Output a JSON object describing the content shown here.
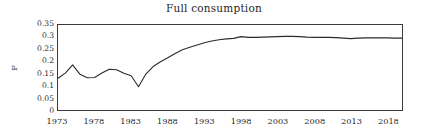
{
  "chart_data": {
    "type": "line",
    "title": "Full consumption",
    "xlabel": "",
    "ylabel": "F",
    "xlim": [
      1973,
      2020
    ],
    "ylim": [
      0,
      0.35
    ],
    "grid": false,
    "legend": null,
    "legend_position": "none",
    "y_ticks": [
      "0.35",
      "0.3",
      "0.25",
      "0.2",
      "0.15",
      "0.1",
      "0.05",
      "0"
    ],
    "y_tick_values": [
      0.35,
      0.3,
      0.25,
      0.2,
      0.15,
      0.1,
      0.05,
      0
    ],
    "x_ticks": [
      "1973",
      "1978",
      "1983",
      "1988",
      "1993",
      "1998",
      "2003",
      "2008",
      "2013",
      "2018"
    ],
    "x_tick_values": [
      1973,
      1978,
      1983,
      1988,
      1993,
      1998,
      2003,
      2008,
      2013,
      2018
    ],
    "line_color": "#2b2b2b",
    "x": [
      1973,
      1974,
      1975,
      1976,
      1977,
      1978,
      1979,
      1980,
      1981,
      1982,
      1983,
      1984,
      1985,
      1986,
      1987,
      1988,
      1989,
      1990,
      1991,
      1992,
      1993,
      1994,
      1995,
      1996,
      1997,
      1998,
      1999,
      2000,
      2001,
      2002,
      2003,
      2004,
      2005,
      2006,
      2007,
      2008,
      2009,
      2010,
      2011,
      2012,
      2013,
      2014,
      2015,
      2016,
      2017,
      2018,
      2019,
      2020
    ],
    "series": [
      {
        "name": "F",
        "values": [
          0.131,
          0.152,
          0.186,
          0.147,
          0.133,
          0.134,
          0.152,
          0.168,
          0.166,
          0.151,
          0.141,
          0.096,
          0.148,
          0.179,
          0.199,
          0.215,
          0.233,
          0.248,
          0.258,
          0.268,
          0.277,
          0.284,
          0.289,
          0.293,
          0.295,
          0.302,
          0.299,
          0.299,
          0.3,
          0.301,
          0.302,
          0.303,
          0.303,
          0.302,
          0.3,
          0.299,
          0.299,
          0.299,
          0.298,
          0.296,
          0.294,
          0.296,
          0.297,
          0.297,
          0.297,
          0.297,
          0.296,
          0.296
        ]
      }
    ]
  }
}
